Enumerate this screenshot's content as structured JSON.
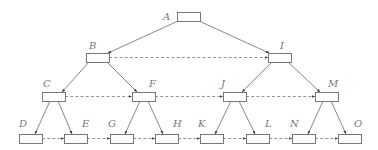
{
  "diagram": {
    "type": "binary tree with level links",
    "colors": {
      "stroke": "#6a6a6a",
      "label": "#777777",
      "background": "#ffffff"
    },
    "nodes": [
      {
        "id": "A",
        "label": "A",
        "x": 177,
        "y": 12,
        "lx": 163,
        "ly": 20
      },
      {
        "id": "B",
        "label": "B",
        "x": 86,
        "y": 53,
        "lx": 89,
        "ly": 49
      },
      {
        "id": "I",
        "label": "I",
        "x": 268,
        "y": 53,
        "lx": 280,
        "ly": 49
      },
      {
        "id": "C",
        "label": "C",
        "x": 42,
        "y": 92,
        "lx": 43,
        "ly": 87
      },
      {
        "id": "F",
        "label": "F",
        "x": 132,
        "y": 92,
        "lx": 149,
        "ly": 87
      },
      {
        "id": "J",
        "label": "J",
        "x": 223,
        "y": 92,
        "lx": 221,
        "ly": 87
      },
      {
        "id": "M",
        "label": "M",
        "x": 315,
        "y": 92,
        "lx": 328,
        "ly": 87
      },
      {
        "id": "D",
        "label": "D",
        "x": 19,
        "y": 134,
        "lx": 19,
        "ly": 127
      },
      {
        "id": "E",
        "label": "E",
        "x": 64,
        "y": 134,
        "lx": 82,
        "ly": 127
      },
      {
        "id": "G",
        "label": "G",
        "x": 110,
        "y": 134,
        "lx": 108,
        "ly": 127
      },
      {
        "id": "H",
        "label": "H",
        "x": 155,
        "y": 134,
        "lx": 173,
        "ly": 127
      },
      {
        "id": "K",
        "label": "K",
        "x": 200,
        "y": 134,
        "lx": 198,
        "ly": 127
      },
      {
        "id": "L",
        "label": "L",
        "x": 246,
        "y": 134,
        "lx": 265,
        "ly": 127
      },
      {
        "id": "N",
        "label": "N",
        "x": 292,
        "y": 134,
        "lx": 290,
        "ly": 127
      },
      {
        "id": "O",
        "label": "O",
        "x": 338,
        "y": 134,
        "lx": 354,
        "ly": 127
      }
    ],
    "node_size": {
      "w": 23,
      "h": 9
    },
    "edges": [
      {
        "from": "A",
        "to": "B",
        "x1": 178,
        "y1": 21,
        "x2": 108,
        "y2": 53
      },
      {
        "from": "A",
        "to": "I",
        "x1": 199,
        "y1": 21,
        "x2": 269,
        "y2": 53
      },
      {
        "from": "B",
        "to": "C",
        "x1": 89,
        "y1": 62,
        "x2": 62,
        "y2": 92
      },
      {
        "from": "B",
        "to": "F",
        "x1": 107,
        "y1": 62,
        "x2": 137,
        "y2": 92
      },
      {
        "from": "I",
        "to": "J",
        "x1": 272,
        "y1": 62,
        "x2": 242,
        "y2": 92
      },
      {
        "from": "I",
        "to": "M",
        "x1": 288,
        "y1": 62,
        "x2": 320,
        "y2": 92
      },
      {
        "from": "C",
        "to": "D",
        "x1": 50,
        "y1": 101,
        "x2": 35,
        "y2": 134
      },
      {
        "from": "C",
        "to": "E",
        "x1": 58,
        "y1": 101,
        "x2": 72,
        "y2": 134
      },
      {
        "from": "F",
        "to": "G",
        "x1": 140,
        "y1": 101,
        "x2": 125,
        "y2": 134
      },
      {
        "from": "F",
        "to": "H",
        "x1": 148,
        "y1": 101,
        "x2": 163,
        "y2": 134
      },
      {
        "from": "J",
        "to": "K",
        "x1": 231,
        "y1": 101,
        "x2": 215,
        "y2": 134
      },
      {
        "from": "J",
        "to": "L",
        "x1": 239,
        "y1": 101,
        "x2": 255,
        "y2": 134
      },
      {
        "from": "M",
        "to": "N",
        "x1": 323,
        "y1": 101,
        "x2": 308,
        "y2": 134
      },
      {
        "from": "M",
        "to": "O",
        "x1": 331,
        "y1": 101,
        "x2": 346,
        "y2": 134
      }
    ],
    "level_links": [
      {
        "from": "B",
        "to": "I",
        "x1": 109,
        "y1": 57.5,
        "x2": 268,
        "y2": 57.5
      },
      {
        "from": "C",
        "to": "F",
        "x1": 65,
        "y1": 96.5,
        "x2": 132,
        "y2": 96.5
      },
      {
        "from": "F",
        "to": "J",
        "x1": 155,
        "y1": 96.5,
        "x2": 223,
        "y2": 96.5
      },
      {
        "from": "J",
        "to": "M",
        "x1": 246,
        "y1": 96.5,
        "x2": 315,
        "y2": 96.5
      },
      {
        "from": "D",
        "to": "E",
        "x1": 42,
        "y1": 138.5,
        "x2": 64,
        "y2": 138.5
      },
      {
        "from": "E",
        "to": "G",
        "x1": 87,
        "y1": 138.5,
        "x2": 110,
        "y2": 138.5
      },
      {
        "from": "G",
        "to": "H",
        "x1": 133,
        "y1": 138.5,
        "x2": 155,
        "y2": 138.5
      },
      {
        "from": "H",
        "to": "K",
        "x1": 178,
        "y1": 138.5,
        "x2": 200,
        "y2": 138.5
      },
      {
        "from": "K",
        "to": "L",
        "x1": 223,
        "y1": 138.5,
        "x2": 246,
        "y2": 138.5
      },
      {
        "from": "L",
        "to": "N",
        "x1": 269,
        "y1": 138.5,
        "x2": 292,
        "y2": 138.5
      },
      {
        "from": "N",
        "to": "O",
        "x1": 315,
        "y1": 138.5,
        "x2": 338,
        "y2": 138.5
      }
    ]
  }
}
